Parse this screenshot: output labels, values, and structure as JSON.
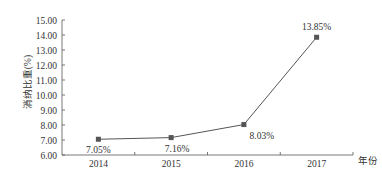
{
  "chart_data": {
    "type": "line",
    "title": "",
    "xlabel": "年份",
    "ylabel": "消纳比重(%)",
    "categories": [
      "2014",
      "2015",
      "2016",
      "2017"
    ],
    "series": [
      {
        "name": "消纳比重",
        "values": [
          7.05,
          7.16,
          8.03,
          13.85
        ]
      }
    ],
    "data_labels": [
      "7.05%",
      "7.16%",
      "8.03%",
      "13.85%"
    ],
    "ylim": [
      6.0,
      15.0
    ],
    "yticks": [
      "6.00",
      "7.00",
      "8.00",
      "9.00",
      "10.00",
      "11.00",
      "12.00",
      "13.00",
      "14.00",
      "15.00"
    ],
    "grid": false,
    "legend": "none",
    "line_color": "#555555",
    "marker": "square"
  }
}
